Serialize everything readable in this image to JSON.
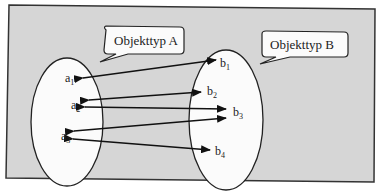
{
  "diagram": {
    "background": "#d6d6d6",
    "frame_color": "#333333",
    "set_a": {
      "callout": "Objekttyp A",
      "elements": [
        {
          "base": "a",
          "sub": "1"
        },
        {
          "base": "a",
          "sub": "2"
        },
        {
          "base": "a",
          "sub": "3"
        }
      ]
    },
    "set_b": {
      "callout": "Objekttyp B",
      "elements": [
        {
          "base": "b",
          "sub": "1"
        },
        {
          "base": "b",
          "sub": "2"
        },
        {
          "base": "b",
          "sub": "3"
        },
        {
          "base": "b",
          "sub": "4"
        }
      ]
    },
    "relations": [
      {
        "from": "a1",
        "to": "b1"
      },
      {
        "from": "a2",
        "to": "b2"
      },
      {
        "from": "a2",
        "to": "b3"
      },
      {
        "from": "a3",
        "to": "b3"
      },
      {
        "from": "a3",
        "to": "b4"
      }
    ]
  }
}
